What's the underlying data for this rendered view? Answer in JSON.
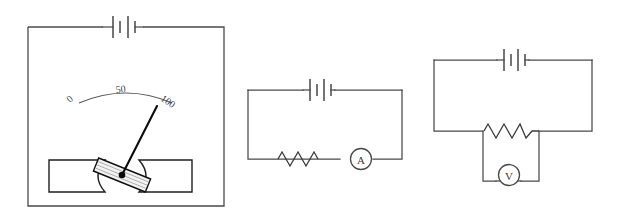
{
  "figure": {
    "background_color": "#ffffff",
    "line_color": "#4a4a4a",
    "accent_color": "#0b0b0b",
    "width": 621,
    "height": 221
  },
  "panels": [
    {
      "id": "galvanometer",
      "name": "moving-coil-meter-panel",
      "caption": "",
      "components": [
        {
          "type": "battery",
          "name": "battery-symbol",
          "cells": 2,
          "label": ""
        },
        {
          "type": "scale",
          "name": "meter-scale",
          "label": ""
        },
        {
          "type": "needle",
          "name": "meter-needle",
          "label": ""
        },
        {
          "type": "coil",
          "name": "moving-coil",
          "label": ""
        },
        {
          "type": "magnet-pole",
          "name": "magnet-pole-left",
          "label": ""
        },
        {
          "type": "magnet-pole",
          "name": "magnet-pole-right",
          "label": ""
        }
      ],
      "scale": {
        "name": "meter-scale",
        "ticks": [
          {
            "value": "0",
            "rotation": -42
          },
          {
            "value": "50",
            "rotation": -6
          },
          {
            "value": "100",
            "rotation": 34
          }
        ],
        "min": 0,
        "max": 100,
        "needle_reading": 93
      }
    },
    {
      "id": "ammeter-circuit",
      "name": "ammeter-circuit-panel",
      "caption": "",
      "components": [
        {
          "type": "battery",
          "name": "battery-symbol",
          "cells": 2,
          "label": ""
        },
        {
          "type": "resistor",
          "name": "resistor-symbol",
          "label": ""
        },
        {
          "type": "ammeter",
          "name": "ammeter-symbol",
          "label": "A"
        }
      ]
    },
    {
      "id": "voltmeter-circuit",
      "name": "voltmeter-circuit-panel",
      "caption": "",
      "components": [
        {
          "type": "battery",
          "name": "battery-symbol",
          "cells": 2,
          "label": ""
        },
        {
          "type": "resistor",
          "name": "resistor-symbol",
          "label": ""
        },
        {
          "type": "voltmeter",
          "name": "voltmeter-symbol",
          "label": "V"
        }
      ]
    }
  ],
  "labels": {
    "ammeter_letter": "A",
    "voltmeter_letter": "V",
    "scale_zero": "0",
    "scale_mid": "50",
    "scale_max": "100"
  }
}
